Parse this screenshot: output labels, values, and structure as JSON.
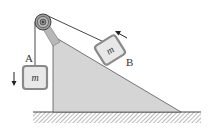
{
  "diagram": {
    "type": "pulley-incline",
    "labels": {
      "block_a": "A",
      "block_b": "B",
      "mass_a": "m",
      "mass_b": "m"
    },
    "arrows": {
      "block_a_direction": "down",
      "block_b_direction": "up-slope"
    },
    "colors": {
      "incline_fill": "#d4d4d4",
      "block_fill": "#e6e6e6",
      "block_border": "#8a8a8a",
      "line": "#333333",
      "ground_hatch": "#555555"
    }
  }
}
